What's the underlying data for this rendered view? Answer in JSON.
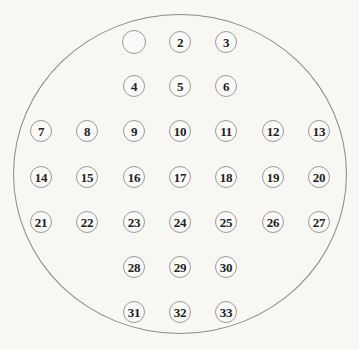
{
  "figure": {
    "background_color": "#f8f7f4",
    "boundary": {
      "shape": "ellipse",
      "stroke_color": "#8a8a8a",
      "center_x": 180,
      "center_y": 174,
      "radius_x": 167,
      "radius_y": 160
    },
    "node_style": {
      "stroke_color": "#9a9a9a",
      "fill_color": "#fbfaf8",
      "text_color": "#222222",
      "radius": 11,
      "empty_node_radius": 12
    },
    "nodes": [
      {
        "label": "",
        "x": 134,
        "y": 42
      },
      {
        "label": "2",
        "x": 180,
        "y": 42
      },
      {
        "label": "3",
        "x": 226,
        "y": 42
      },
      {
        "label": "4",
        "x": 134,
        "y": 86
      },
      {
        "label": "5",
        "x": 180,
        "y": 86
      },
      {
        "label": "6",
        "x": 226,
        "y": 86
      },
      {
        "label": "7",
        "x": 41,
        "y": 131
      },
      {
        "label": "8",
        "x": 87,
        "y": 131
      },
      {
        "label": "9",
        "x": 134,
        "y": 131
      },
      {
        "label": "10",
        "x": 180,
        "y": 131
      },
      {
        "label": "11",
        "x": 226,
        "y": 131
      },
      {
        "label": "12",
        "x": 273,
        "y": 131
      },
      {
        "label": "13",
        "x": 319,
        "y": 131
      },
      {
        "label": "14",
        "x": 41,
        "y": 177
      },
      {
        "label": "15",
        "x": 87,
        "y": 177
      },
      {
        "label": "16",
        "x": 134,
        "y": 177
      },
      {
        "label": "17",
        "x": 180,
        "y": 177
      },
      {
        "label": "18",
        "x": 226,
        "y": 177
      },
      {
        "label": "19",
        "x": 273,
        "y": 177
      },
      {
        "label": "20",
        "x": 319,
        "y": 177
      },
      {
        "label": "21",
        "x": 41,
        "y": 222
      },
      {
        "label": "22",
        "x": 87,
        "y": 222
      },
      {
        "label": "23",
        "x": 134,
        "y": 222
      },
      {
        "label": "24",
        "x": 180,
        "y": 222
      },
      {
        "label": "25",
        "x": 226,
        "y": 222
      },
      {
        "label": "26",
        "x": 273,
        "y": 222
      },
      {
        "label": "27",
        "x": 319,
        "y": 222
      },
      {
        "label": "28",
        "x": 134,
        "y": 267
      },
      {
        "label": "29",
        "x": 180,
        "y": 267
      },
      {
        "label": "30",
        "x": 226,
        "y": 267
      },
      {
        "label": "31",
        "x": 134,
        "y": 312
      },
      {
        "label": "32",
        "x": 180,
        "y": 312
      },
      {
        "label": "33",
        "x": 226,
        "y": 312
      }
    ]
  }
}
